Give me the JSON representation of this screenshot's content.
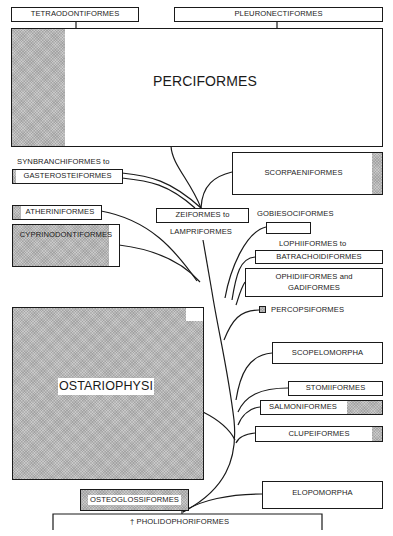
{
  "diagram": {
    "type": "phylogenetic tree of teleost fish orders",
    "taxa": {
      "tetraodontiformes": "TETRAODONTIFORMES",
      "pleuronectiformes": "PLEURONECTIFORMES",
      "perciformes": "PERCIFORMES",
      "synbranchiformes_to": "SYNBRANCHIFORMES to",
      "gasterosteiformes": "GASTEROSTEIFORMES",
      "scorpaeniformes": "SCORPAENIFORMES",
      "atheriniformes": "ATHERINIFORMES",
      "cyprinodontiformes": "CYPRINODONTIFORMES",
      "zeiformes_to": "ZEIFORMES to",
      "lampriformes": "LAMPRIFORMES",
      "gobiesociformes": "GOBIESOCIFORMES",
      "lophiiformes_to": "LOPHIIFORMES to",
      "batrachoidiformes": "BATRACHOIDIFORMES",
      "ophidiiformes_and": "OPHIDIIFORMES and",
      "gadiformes": "GADIFORMES",
      "percopsiformes": "PERCOPSIFORMES",
      "ostariophysi": "OSTARIOPHYSI",
      "scopelomorpha": "SCOPELOMORPHA",
      "stomiiformes": "STOMIIFORMES",
      "salmoniformes": "SALMONIFORMES",
      "clupeiformes": "CLUPEIFORMES",
      "osteoglossiformes": "OSTEOGLOSSIFORMES",
      "elopomorpha": "ELOPOMORPHA",
      "pholidophoriformes": "† PHOLIDOPHORIFORMES"
    },
    "colors": {
      "line": "#1a1a1a",
      "hatch": "#c9c9c9",
      "background": "#ffffff"
    }
  }
}
